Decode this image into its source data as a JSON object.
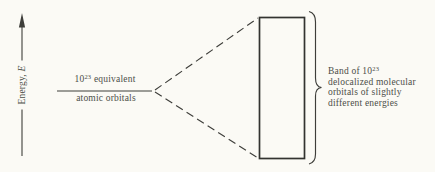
{
  "colors": {
    "bg": "#fbfaf5",
    "ink": "#3e3e3a",
    "text": "#4c4e48",
    "rect-ink": "#333330"
  },
  "energy_axis": {
    "label_prefix": "Energy, ",
    "label_var": "E"
  },
  "atomic_level": {
    "count_base": "10",
    "count_exp": "23",
    "count_rest": " equivalent",
    "line2": "atomic orbitals"
  },
  "band": {
    "line1_prefix": "Band of 10",
    "line1_exp": "23",
    "line2": "delocalized molecular",
    "line3": "orbitals of slightly",
    "line4": "different energies"
  }
}
